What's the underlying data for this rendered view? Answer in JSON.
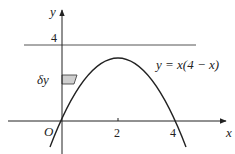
{
  "figure": {
    "type": "function-graph",
    "equation_label": "y = x(4 − x)",
    "axes": {
      "x_label": "x",
      "y_label": "y",
      "origin_label": "O"
    },
    "x_ticks": [
      {
        "value": 2,
        "label": "2"
      },
      {
        "value": 4,
        "label": "4"
      }
    ],
    "y_ticks": [
      {
        "value": 4,
        "label": "4"
      }
    ],
    "horizontal_line": {
      "y": 4
    },
    "strip": {
      "label": "δy",
      "fill": "#cfcfcf"
    },
    "colors": {
      "line": "#222222",
      "reference_line": "#555555"
    }
  }
}
